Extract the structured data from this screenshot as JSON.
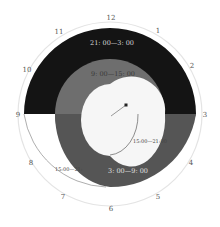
{
  "diagram": {
    "type": "24-hour clock shift diagram",
    "center": [
      110,
      114
    ],
    "clock_numbers": [
      "12",
      "1",
      "2",
      "3",
      "4",
      "5",
      "6",
      "7",
      "8",
      "9",
      "10",
      "11"
    ],
    "segments": [
      {
        "label": "21: 00—3: 00",
        "color": "#141414",
        "text_color": "#d8d8d8"
      },
      {
        "label": "9: 00—15: 00",
        "color": "#6e6e6e",
        "text_color": "#3a3a3a"
      },
      {
        "label": "3: 00—9: 00",
        "color": "#555555",
        "text_color": "#e0e0e0"
      },
      {
        "label": "15:00—21:00",
        "color": "#ffffff",
        "text_color": "#444444"
      },
      {
        "label": "15:00—21:",
        "color": "#ffffff",
        "text_color": "#444444"
      }
    ],
    "colors": {
      "dial_ring": "#e4e4e4",
      "inner_face": "#f6f6f6",
      "hand": "#333333"
    }
  }
}
